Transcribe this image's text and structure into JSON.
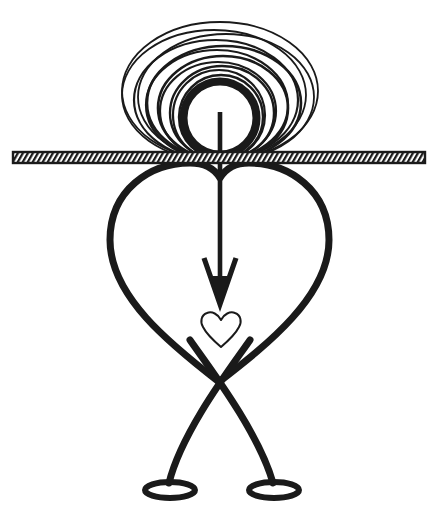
{
  "canvas": {
    "width": 435,
    "height": 517,
    "background_color": "#ffffff",
    "ink_color": "#1a1a1a",
    "title": "Stick figure with heart body and spiral head"
  },
  "artwork": {
    "type": "line-art-illustration",
    "style": "black ink outline drawing, no text labels",
    "elements": [
      {
        "name": "spiral-head",
        "description": "Nested concentric ellipses forming a spiral-like head tangent to the hatched bar",
        "ring_count": 11,
        "center_x": 220,
        "baseline_y": 160,
        "outer_rx": 98,
        "outer_ry": 69,
        "inner_rx": 38,
        "inner_ry": 38
      },
      {
        "name": "head-core-circle",
        "description": "Thick inner circle of the head",
        "center_x": 220,
        "center_y": 118,
        "radius": 37,
        "stroke_width": 8
      },
      {
        "name": "hatched-bar",
        "description": "Horizontal ground bar filled with diagonal hatch lines",
        "x": 13,
        "y": 152,
        "width": 412,
        "height": 11,
        "hatch_angle_deg": 60,
        "hatch_spacing": 5
      },
      {
        "name": "heart-body",
        "description": "Large open heart outline forming the torso, lobes touching the bar",
        "left_x": 109,
        "right_x": 329,
        "top_y": 163,
        "bottom_y": 383,
        "stroke_width": 7
      },
      {
        "name": "down-arrow",
        "description": "Vertical arrow from head centre pointing down into the small heart",
        "shaft_x": 220,
        "shaft_top_y": 118,
        "tip_y": 305,
        "head_half_width": 16,
        "head_top_y": 258,
        "stroke_width": 5
      },
      {
        "name": "small-heart",
        "description": "Small thin-outline heart below the arrow tip",
        "center_x": 221,
        "top_y": 312,
        "bottom_y": 347,
        "width": 38,
        "stroke_width": 2
      },
      {
        "name": "crossed-legs",
        "description": "Two legs descending from the heart lobes, crossing near the centre",
        "cross_x": 219,
        "cross_y": 383,
        "stroke_width": 7
      },
      {
        "name": "left-foot",
        "description": "Flat ellipse outline foot",
        "center_x": 170,
        "center_y": 490,
        "rx": 25,
        "ry": 8,
        "stroke_width": 6
      },
      {
        "name": "right-foot",
        "description": "Flat ellipse outline foot",
        "center_x": 274,
        "center_y": 490,
        "rx": 25,
        "ry": 8,
        "stroke_width": 6
      }
    ]
  }
}
